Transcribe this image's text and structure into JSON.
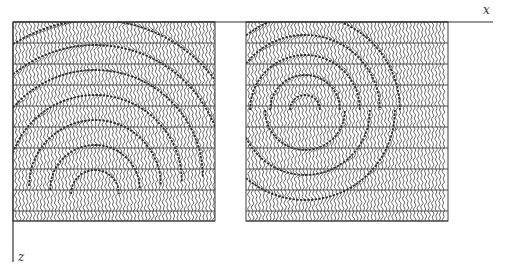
{
  "figure": {
    "type": "seismic-wiggle-panels",
    "axes": {
      "x_label": "x",
      "z_label": "z"
    },
    "colors": {
      "ink": "#2a2a2a",
      "grid": "#3a3a3a",
      "background": "#ffffff"
    },
    "panels": [
      {
        "id": "left",
        "x0": 13,
        "x1": 215,
        "y0": 22,
        "y1": 221,
        "description": "wiggle traces with stacked downward-opening arcs converging toward a point near left-center"
      },
      {
        "id": "right",
        "x0": 246,
        "x1": 448,
        "y0": 22,
        "y1": 221,
        "description": "wiggle traces with concentric arcs around a focus near upper-center"
      }
    ],
    "grid_rows_y": [
      22,
      43,
      64,
      85,
      106,
      127,
      148,
      169,
      190,
      211,
      221
    ],
    "x_axis": {
      "y": 22,
      "x_start": 13,
      "x_end": 493
    },
    "z_axis": {
      "x": 13,
      "y_start": 22,
      "y_end": 262
    }
  }
}
